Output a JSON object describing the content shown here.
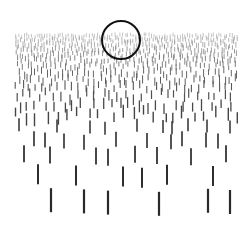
{
  "figure": {
    "width": 251,
    "height": 232,
    "background": "#ffffff",
    "horizon": {
      "y": 33,
      "x_start": 15,
      "x_end": 238
    },
    "circle": {
      "cx": 121,
      "cy": 40,
      "r": 19,
      "stroke": "#111111",
      "stroke_width": 2
    },
    "dense_rows": [
      {
        "y": 34,
        "len": 4,
        "step": 2.6,
        "width": 0.6,
        "color": "#9a9a9a"
      },
      {
        "y": 38,
        "len": 4,
        "step": 2.8,
        "width": 0.7,
        "color": "#939393"
      },
      {
        "y": 42,
        "len": 5,
        "step": 3.1,
        "width": 0.7,
        "color": "#8c8c8c"
      },
      {
        "y": 47,
        "len": 5,
        "step": 3.4,
        "width": 0.8,
        "color": "#858585"
      },
      {
        "y": 52,
        "len": 5,
        "step": 3.8,
        "width": 0.8,
        "color": "#7d7d7d"
      },
      {
        "y": 57,
        "len": 6,
        "step": 4.2,
        "width": 0.9,
        "color": "#767676"
      },
      {
        "y": 63,
        "len": 6,
        "step": 4.8,
        "width": 0.9,
        "color": "#6e6e6e"
      },
      {
        "y": 69,
        "len": 7,
        "step": 5.4,
        "width": 1.0,
        "color": "#666666"
      },
      {
        "y": 76,
        "len": 7,
        "step": 6.2,
        "width": 1.0,
        "color": "#5e5e5e"
      },
      {
        "y": 83,
        "len": 8,
        "step": 7.0,
        "width": 1.1,
        "color": "#575757"
      },
      {
        "y": 91,
        "len": 9,
        "step": 8.0,
        "width": 1.2,
        "color": "#505050"
      },
      {
        "y": 100,
        "len": 10,
        "step": 9.2,
        "width": 1.3,
        "color": "#494949"
      },
      {
        "y": 109,
        "len": 11,
        "step": 10.5,
        "width": 1.4,
        "color": "#444444"
      }
    ],
    "sparse_rows": [
      {
        "y": 120,
        "len": 13,
        "width": 1.6,
        "color": "#3c3c3c",
        "xs": [
          19,
          57,
          90,
          105,
          137,
          163,
          172,
          188,
          207,
          230
        ]
      },
      {
        "y": 133,
        "len": 15,
        "width": 1.7,
        "color": "#383838",
        "xs": [
          34,
          45,
          64,
          84,
          116,
          147,
          171,
          182,
          206,
          218
        ]
      },
      {
        "y": 147,
        "len": 17,
        "width": 1.8,
        "color": "#333333",
        "xs": [
          24,
          50,
          96,
          108,
          135,
          157,
          191,
          226
        ]
      },
      {
        "y": 166,
        "len": 20,
        "width": 2.0,
        "color": "#2e2e2e",
        "xs": [
          38,
          76,
          123,
          142,
          167,
          213
        ]
      },
      {
        "y": 190,
        "len": 24,
        "width": 2.2,
        "color": "#2a2a2a",
        "xs": [
          51,
          84,
          108,
          159,
          208,
          230
        ]
      }
    ]
  }
}
